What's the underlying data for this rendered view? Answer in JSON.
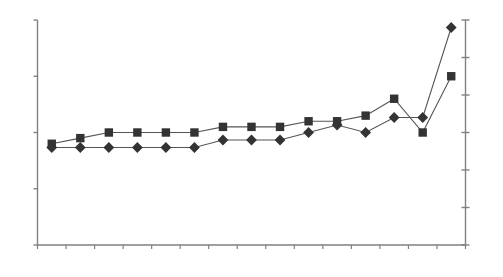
{
  "chart_data": {
    "type": "line",
    "title": "",
    "subtitle": "",
    "xlabel": "",
    "ylabel": "",
    "grid": false,
    "legend": "none",
    "categories": [
      "2012",
      "2013",
      "2014",
      "2015",
      "2016",
      "2017",
      "2018",
      "2019",
      "2020",
      "2021",
      "2022",
      "2023",
      "2024",
      "2025",
      "2026"
    ],
    "left_axis": {
      "ylim": [
        1.3,
        1.7
      ],
      "ticks": [
        "1.30",
        "1.40",
        "1.50",
        "1.60",
        "1.70"
      ],
      "tick_values": [
        1.3,
        1.4,
        1.5,
        1.6,
        1.7
      ]
    },
    "right_axis": {
      "ylim": [
        1.4,
        1.7
      ],
      "ticks": [
        "1.40",
        "1.45",
        "1.50",
        "1.55",
        "1.60",
        "1.65",
        "1.70"
      ],
      "tick_values": [
        1.4,
        1.45,
        1.5,
        1.55,
        1.6,
        1.65,
        1.7
      ]
    },
    "series": [
      {
        "name": "square-series",
        "marker": "square",
        "axis": "left",
        "values": [
          1.48,
          1.49,
          1.5,
          1.5,
          1.5,
          1.5,
          1.51,
          1.51,
          1.51,
          1.52,
          1.52,
          1.53,
          1.56,
          1.5,
          1.6
        ],
        "labels": [
          "1.48",
          "1.49",
          "1.50",
          "1.50",
          "1.50",
          "1.50",
          "1.51",
          "1.51",
          "1.51",
          "1.52",
          "1.52",
          "1.53",
          "1.56",
          "1.50",
          "1.60"
        ],
        "label_position": [
          "above",
          "above",
          "above",
          "above",
          "above",
          "above",
          "above",
          "above",
          "above",
          "above",
          "above",
          "above",
          "above",
          "right",
          "right"
        ]
      },
      {
        "name": "diamond-series",
        "marker": "diamond",
        "axis": "right",
        "values": [
          1.53,
          1.53,
          1.53,
          1.53,
          1.53,
          1.53,
          1.54,
          1.54,
          1.54,
          1.55,
          1.56,
          1.55,
          1.57,
          1.57,
          1.69
        ],
        "labels": [
          "1.53",
          "1.53",
          "1.53",
          "1.53",
          "1.53",
          "1.53",
          "1.54",
          "1.54",
          "1.54",
          "1.55",
          "1.56",
          "1.55",
          "1.57",
          "1.57",
          "1.69"
        ],
        "label_position": [
          "below",
          "below",
          "below",
          "below",
          "below",
          "below",
          "below",
          "below",
          "below",
          "below",
          "below",
          "below",
          "below",
          "below",
          "right"
        ]
      }
    ],
    "colors": {
      "line": "#555555",
      "marker": "#333333",
      "axis": "#808080",
      "text": "#3a3a3a",
      "background": "#ffffff"
    }
  }
}
